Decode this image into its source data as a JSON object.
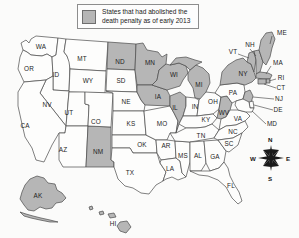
{
  "legend": {
    "swatch_color": "#b6b6b6",
    "line1": "States that had abolished the",
    "line2": "death penalty as of early 2013"
  },
  "colors": {
    "shaded": "#b6b6b6",
    "plain": "#fdfdfc",
    "outline": "#4a4a4a",
    "background": "#fbfbfa"
  },
  "compass": {
    "north": "N",
    "south": "S",
    "east": "E",
    "west": "W"
  },
  "map_data": {
    "type": "choropleth",
    "region": "United States",
    "categories": [
      "abolished",
      "not abolished"
    ],
    "shaded_states": [
      "AK",
      "HI",
      "NM",
      "ND",
      "MN",
      "WI",
      "IA",
      "IL",
      "MI",
      "WV",
      "NY",
      "VT",
      "NH",
      "ME",
      "MA",
      "RI",
      "CT",
      "NJ"
    ],
    "states": [
      {
        "code": "WA",
        "shaded": false,
        "label_x": 41,
        "label_y": 47
      },
      {
        "code": "OR",
        "shaded": false,
        "label_x": 29,
        "label_y": 69
      },
      {
        "code": "ID",
        "shaded": false,
        "label_x": 56,
        "label_y": 75
      },
      {
        "code": "MT",
        "shaded": false,
        "label_x": 82,
        "label_y": 59
      },
      {
        "code": "WY",
        "shaded": false,
        "label_x": 88,
        "label_y": 81
      },
      {
        "code": "NV",
        "shaded": false,
        "label_x": 47,
        "label_y": 105
      },
      {
        "code": "UT",
        "shaded": false,
        "label_x": 69,
        "label_y": 113
      },
      {
        "code": "CA",
        "shaded": false,
        "label_x": 25,
        "label_y": 126
      },
      {
        "code": "AZ",
        "shaded": false,
        "label_x": 63,
        "label_y": 150
      },
      {
        "code": "NM",
        "shaded": true,
        "label_x": 98,
        "label_y": 152
      },
      {
        "code": "CO",
        "shaded": false,
        "label_x": 96,
        "label_y": 122
      },
      {
        "code": "ND",
        "shaded": true,
        "label_x": 120,
        "label_y": 62
      },
      {
        "code": "SD",
        "shaded": false,
        "label_x": 121,
        "label_y": 81
      },
      {
        "code": "NE",
        "shaded": false,
        "label_x": 126,
        "label_y": 102
      },
      {
        "code": "KS",
        "shaded": false,
        "label_x": 131,
        "label_y": 124
      },
      {
        "code": "OK",
        "shaded": false,
        "label_x": 142,
        "label_y": 145
      },
      {
        "code": "TX",
        "shaded": false,
        "label_x": 130,
        "label_y": 173
      },
      {
        "code": "MN",
        "shaded": true,
        "label_x": 150,
        "label_y": 63
      },
      {
        "code": "IA",
        "shaded": true,
        "label_x": 158,
        "label_y": 97
      },
      {
        "code": "MO",
        "shaded": false,
        "label_x": 162,
        "label_y": 124
      },
      {
        "code": "AR",
        "shaded": false,
        "label_x": 166,
        "label_y": 146
      },
      {
        "code": "LA",
        "shaded": false,
        "label_x": 170,
        "label_y": 169
      },
      {
        "code": "WI",
        "shaded": true,
        "label_x": 174,
        "label_y": 75
      },
      {
        "code": "IL",
        "shaded": true,
        "label_x": 175,
        "label_y": 108
      },
      {
        "code": "MS",
        "shaded": false,
        "label_x": 183,
        "label_y": 156
      },
      {
        "code": "MI",
        "shaded": true,
        "label_x": 199,
        "label_y": 85
      },
      {
        "code": "IN",
        "shaded": false,
        "label_x": 195,
        "label_y": 107
      },
      {
        "code": "KY",
        "shaded": false,
        "label_x": 206,
        "label_y": 120
      },
      {
        "code": "TN",
        "shaded": false,
        "label_x": 201,
        "label_y": 136
      },
      {
        "code": "AL",
        "shaded": false,
        "label_x": 198,
        "label_y": 156
      },
      {
        "code": "OH",
        "shaded": false,
        "label_x": 213,
        "label_y": 102
      },
      {
        "code": "GA",
        "shaded": false,
        "label_x": 215,
        "label_y": 157
      },
      {
        "code": "FL",
        "shaded": false,
        "label_x": 231,
        "label_y": 186
      },
      {
        "code": "WV",
        "shaded": true,
        "label_x": 224,
        "label_y": 113
      },
      {
        "code": "SC",
        "shaded": false,
        "label_x": 229,
        "label_y": 144
      },
      {
        "code": "NC",
        "shaded": false,
        "label_x": 233,
        "label_y": 132
      },
      {
        "code": "VA",
        "shaded": false,
        "label_x": 238,
        "label_y": 119
      },
      {
        "code": "PA",
        "shaded": false,
        "label_x": 233,
        "label_y": 93
      },
      {
        "code": "NY",
        "shaded": true,
        "label_x": 243,
        "label_y": 74
      }
    ],
    "callout_labels": [
      {
        "code": "ME",
        "label_x": 282,
        "label_y": 33
      },
      {
        "code": "NH",
        "label_x": 250,
        "label_y": 45
      },
      {
        "code": "VT",
        "label_x": 233,
        "label_y": 52
      },
      {
        "code": "MA",
        "label_x": 278,
        "label_y": 63
      },
      {
        "code": "RI",
        "label_x": 281,
        "label_y": 78
      },
      {
        "code": "CT",
        "label_x": 281,
        "label_y": 88
      },
      {
        "code": "NJ",
        "label_x": 279,
        "label_y": 99
      },
      {
        "code": "DE",
        "label_x": 278,
        "label_y": 110
      },
      {
        "code": "MD",
        "label_x": 272,
        "label_y": 124
      },
      {
        "code": "AK",
        "label_x": 38,
        "label_y": 196
      },
      {
        "code": "HI",
        "label_x": 113,
        "label_y": 224
      }
    ]
  }
}
